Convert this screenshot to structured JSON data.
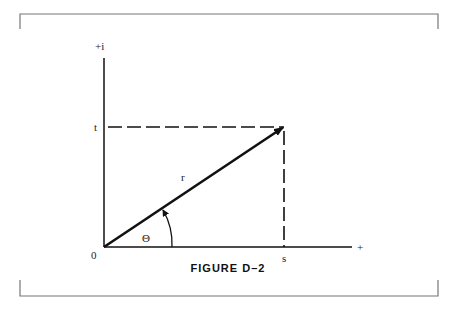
{
  "figure": {
    "caption": "FIGURE D–2",
    "labels": {
      "y_axis": "+i",
      "x_axis": "+",
      "origin": "0",
      "t": "t",
      "s": "s",
      "r": "r",
      "theta": "Θ"
    }
  },
  "colors": {
    "ink": "#111111",
    "frame": "#777777",
    "background": "#ffffff"
  }
}
